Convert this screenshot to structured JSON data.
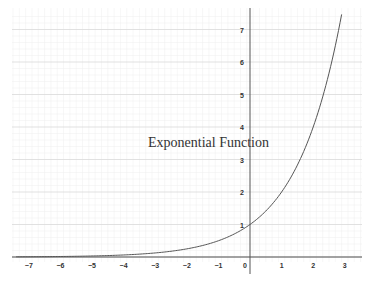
{
  "chart_data": {
    "type": "line",
    "title": "Exponential Function",
    "xlabel": "",
    "ylabel": "",
    "xlim": [
      -7.5,
      3.5
    ],
    "ylim": [
      0,
      7.5
    ],
    "grid": true,
    "legend": null,
    "x_ticks": [
      "-7",
      "-6",
      "-5",
      "-4",
      "-3",
      "-2",
      "-1",
      "0",
      "1",
      "2",
      "3"
    ],
    "y_ticks": [
      "1",
      "2",
      "3",
      "4",
      "5",
      "6",
      "7"
    ],
    "series": [
      {
        "name": "y = 2^x",
        "x": [
          -7,
          -6,
          -5,
          -4,
          -3,
          -2,
          -1,
          0,
          1,
          2,
          2.9
        ],
        "values": [
          0.0078,
          0.0156,
          0.03125,
          0.0625,
          0.125,
          0.25,
          0.5,
          1,
          2,
          4,
          7.46
        ]
      }
    ],
    "annotations": [
      {
        "text": "Exponential Function",
        "x": -1.1,
        "y": 3.6
      }
    ]
  },
  "colors": {
    "curve": "#555555",
    "axis": "#555555",
    "grid_major": "#d9d9d9",
    "grid_minor": "#efefef",
    "text": "#333333"
  }
}
